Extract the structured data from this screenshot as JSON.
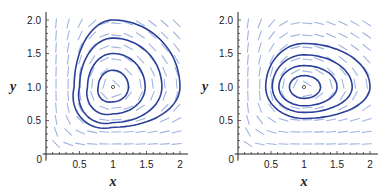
{
  "chart_data": [
    {
      "type": "line",
      "title": "",
      "xlabel": "x",
      "ylabel": "y",
      "xlim": [
        0,
        2.1
      ],
      "ylim": [
        0,
        2.1
      ],
      "xticks": [
        "0",
        "0.5",
        "1",
        "1.5",
        "2"
      ],
      "yticks": [
        "0.5",
        "1.0",
        "1.5",
        "2.0"
      ],
      "equilibrium": [
        1,
        1
      ],
      "description": "Phase portrait with direction field and closed orbits around equilibrium (1,1); orbits are triangular-shaped",
      "orbits": [
        {
          "x_range": [
            0.78,
            1.23
          ],
          "y_range": [
            0.78,
            1.25
          ]
        },
        {
          "x_range": [
            0.62,
            1.48
          ],
          "y_range": [
            0.6,
            1.5
          ]
        },
        {
          "x_range": [
            0.5,
            1.73
          ],
          "y_range": [
            0.47,
            1.73
          ]
        },
        {
          "x_range": [
            0.42,
            2.0
          ],
          "y_range": [
            0.4,
            2.0
          ]
        }
      ],
      "field_color": "#9fb4e0",
      "orbit_color": "#2a3f9a"
    },
    {
      "type": "line",
      "title": "",
      "xlabel": "x",
      "ylabel": "y",
      "xlim": [
        0,
        2.1
      ],
      "ylim": [
        0,
        2.1
      ],
      "xticks": [
        "0",
        "0.5",
        "1",
        "1.5",
        "2"
      ],
      "yticks": [
        "0.5",
        "1.0",
        "1.5",
        "2.0"
      ],
      "equilibrium": [
        1,
        1
      ],
      "description": "Phase portrait with direction field and closed orbits around equilibrium (1,1); orbits are egg-shaped, elongated horizontally",
      "orbits": [
        {
          "x_range": [
            0.78,
            1.25
          ],
          "y_range": [
            0.83,
            1.17
          ]
        },
        {
          "x_range": [
            0.62,
            1.5
          ],
          "y_range": [
            0.72,
            1.32
          ]
        },
        {
          "x_range": [
            0.52,
            1.73
          ],
          "y_range": [
            0.62,
            1.48
          ]
        },
        {
          "x_range": [
            0.42,
            2.0
          ],
          "y_range": [
            0.53,
            1.65
          ]
        }
      ],
      "field_color": "#9fb4e0",
      "orbit_color": "#2a3f9a"
    }
  ],
  "labels": {
    "x": "x",
    "y": "y",
    "origin": "0",
    "xt": [
      "0.5",
      "1",
      "1.5",
      "2"
    ],
    "yt": [
      "0.5",
      "1.0",
      "1.5",
      "2.0"
    ]
  }
}
